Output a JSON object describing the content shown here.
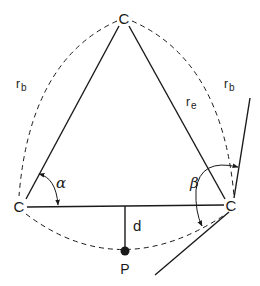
{
  "diagram": {
    "type": "geometric-construction",
    "colors": {
      "stroke": "#1a1a1a",
      "background": "#ffffff"
    },
    "vertices": {
      "top": {
        "label": "C"
      },
      "left": {
        "label": "C"
      },
      "right": {
        "label": "C"
      }
    },
    "point": {
      "label": "P"
    },
    "labels": {
      "rb_left": {
        "main": "r",
        "sub": "b"
      },
      "rb_right": {
        "main": "r",
        "sub": "b"
      },
      "re": {
        "main": "r",
        "sub": "e"
      },
      "d": "d",
      "alpha": "α",
      "beta": "β"
    },
    "edges": [
      {
        "from": "left",
        "to": "top",
        "style": "solid"
      },
      {
        "from": "top",
        "to": "right",
        "style": "solid"
      },
      {
        "from": "left",
        "to": "right",
        "style": "solid"
      },
      {
        "from": "base-midpoint",
        "to": "P",
        "style": "solid",
        "label": "d"
      }
    ],
    "arcs": [
      {
        "from": "left",
        "to": "top",
        "style": "dashed",
        "label": "r_b"
      },
      {
        "from": "top",
        "to": "right",
        "style": "dashed",
        "label": "r_b"
      },
      {
        "from": "left",
        "to": "right",
        "via": "P",
        "style": "dashed"
      }
    ],
    "angles": [
      {
        "at": "left",
        "label": "α"
      },
      {
        "at": "right",
        "label": "β",
        "between": "tangent lines"
      }
    ]
  }
}
